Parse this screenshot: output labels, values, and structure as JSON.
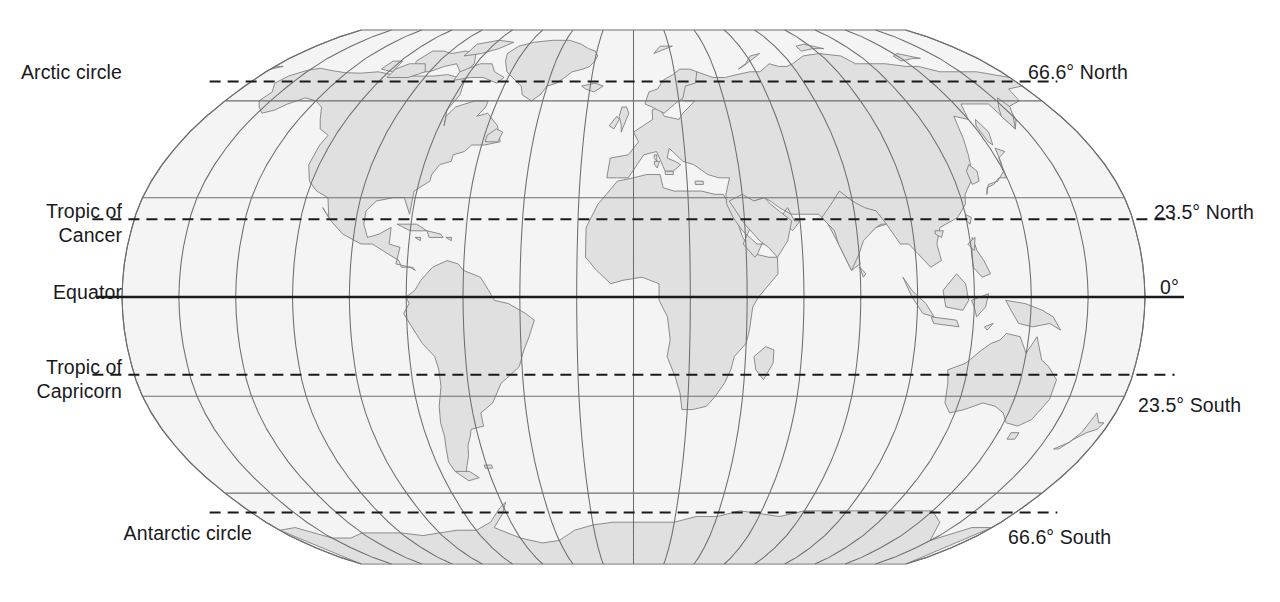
{
  "figure": {
    "projection": "robinson",
    "background_color": "#ffffff",
    "ocean_color": "#f4f4f4",
    "land_color": "#e0e0e0",
    "land_outline_color": "#808083",
    "graticule_color": "#6e6e72",
    "equator_color": "#1a1a1a",
    "dashed_line_color": "#1a1a1a",
    "label_color": "#19191c"
  },
  "latitude_lines": [
    {
      "id": "arctic-circle",
      "left_label": "Arctic circle",
      "right_label": "66.6° North",
      "latitude": 66.6,
      "style": "dashed"
    },
    {
      "id": "tropic-of-cancer",
      "left_label": "Tropic of\nCancer",
      "right_label": "23.5° North",
      "latitude": 23.5,
      "style": "dashed"
    },
    {
      "id": "equator",
      "left_label": "Equator",
      "right_label": "0°",
      "latitude": 0,
      "style": "solid-bold"
    },
    {
      "id": "tropic-of-capricorn",
      "left_label": "Tropic of\nCapricorn",
      "right_label": "23.5° South",
      "latitude": -23.5,
      "style": "dashed"
    },
    {
      "id": "antarctic-circle",
      "left_label": "Antarctic circle",
      "right_label": "66.6° South",
      "latitude": -66.6,
      "style": "dashed"
    }
  ],
  "graticule": {
    "meridian_interval_degrees": 20,
    "parallel_interval_degrees": 30,
    "parallels_degrees": [
      90,
      60,
      30,
      0,
      -30,
      -60,
      -90
    ],
    "meridians_degrees": [
      -180,
      -160,
      -140,
      -120,
      -100,
      -80,
      -60,
      -40,
      -20,
      0,
      20,
      40,
      60,
      80,
      100,
      120,
      140,
      160,
      180
    ]
  }
}
